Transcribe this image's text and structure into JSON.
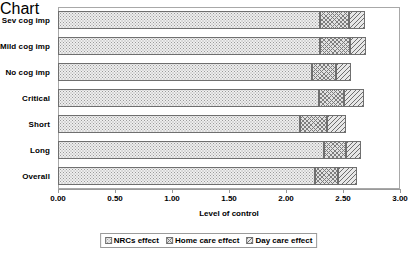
{
  "chart_data": {
    "type": "bar",
    "orientation": "horizontal",
    "stacked": true,
    "title": "",
    "xlabel": "Level of control",
    "ylabel": "",
    "xlim": [
      0,
      3
    ],
    "xticks": [
      "0.00",
      "0.50",
      "1.00",
      "1.50",
      "2.00",
      "2.50",
      "3.00"
    ],
    "xtick_values": [
      0,
      0.5,
      1,
      1.5,
      2,
      2.5,
      3
    ],
    "grid": false,
    "legend_position": "bottom",
    "categories": [
      "Sev cog imp",
      "Mild cog imp",
      "No cog imp",
      "Critical",
      "Short",
      "Long",
      "Overall"
    ],
    "series": [
      {
        "name": "NRCs effect",
        "pattern": "stipple",
        "values": [
          2.3,
          2.3,
          2.23,
          2.29,
          2.12,
          2.33,
          2.25
        ]
      },
      {
        "name": "Home care effect",
        "pattern": "crosshatch",
        "values": [
          0.25,
          0.26,
          0.21,
          0.22,
          0.24,
          0.2,
          0.21
        ]
      },
      {
        "name": "Day care effect",
        "pattern": "diagonal",
        "values": [
          0.14,
          0.14,
          0.13,
          0.17,
          0.17,
          0.13,
          0.16
        ]
      }
    ],
    "totals": [
      2.69,
      2.7,
      2.57,
      2.68,
      2.53,
      2.66,
      2.62
    ]
  },
  "legend": {
    "items": [
      {
        "label": "NRCs effect"
      },
      {
        "label": "Home care effect"
      },
      {
        "label": "Day care effect"
      }
    ]
  },
  "colors": {
    "axis": "#9a9a9a",
    "frame": "#a8a8a8",
    "segment_border": "#6f6f6f",
    "text": "#000000",
    "background": "#ffffff"
  }
}
